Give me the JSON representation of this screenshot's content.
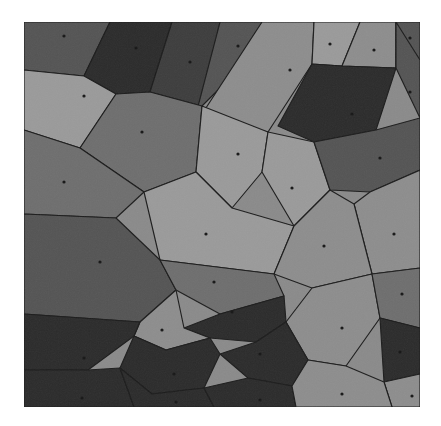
{
  "figure": {
    "kind": "voronoi-tessellation",
    "background_color": "#ffffff",
    "frame": {
      "x": 24,
      "y": 22,
      "width": 396,
      "height": 385
    },
    "boundary_color": "#1c1c1c",
    "boundary_width": 1.15,
    "seed_dot_color": "#161616",
    "seed_dot_radius": 1.6,
    "palette": {
      "very_dark": "#2b2b2b",
      "dark": "#3d3d3d",
      "mid_dark": "#545454",
      "mid": "#6e6e6e",
      "light": "#8d8d8d",
      "lighter": "#9a9a9a"
    }
  },
  "chart_data": {
    "type": "voronoi",
    "title": "",
    "xlabel": "",
    "ylabel": "",
    "xlim": [
      0,
      396
    ],
    "ylim": [
      0,
      385
    ],
    "grid": false,
    "legend": "none",
    "cell_count": 34,
    "cells": [
      {
        "id": 1,
        "fill": "#545454",
        "seed": [
          40,
          14
        ],
        "points": "0,0 86,0 60,54 0,48"
      },
      {
        "id": 2,
        "fill": "#2b2b2b",
        "seed": [
          112,
          26
        ],
        "points": "86,0 148,0 126,70 92,72 60,54"
      },
      {
        "id": 3,
        "fill": "#3d3d3d",
        "seed": [
          166,
          40
        ],
        "points": "148,0 196,0 178,84 126,70"
      },
      {
        "id": 4,
        "fill": "#545454",
        "seed": [
          214,
          24
        ],
        "points": "196,0 238,0 230,32 178,84 172,92"
      },
      {
        "id": 5,
        "fill": "#8d8d8d",
        "seed": [
          266,
          48
        ],
        "points": "238,0 290,0 288,42 244,110 178,92"
      },
      {
        "id": 6,
        "fill": "#9a9a9a",
        "seed": [
          306,
          22
        ],
        "points": "290,0 336,0 318,44 288,42"
      },
      {
        "id": 7,
        "fill": "#8d8d8d",
        "seed": [
          350,
          28
        ],
        "points": "336,0 372,0 372,46 318,44"
      },
      {
        "id": 8,
        "fill": "#545454",
        "seed": [
          386,
          16
        ],
        "points": "372,0 396,0 396,38 372,46"
      },
      {
        "id": 9,
        "fill": "#9a9a9a",
        "seed": [
          60,
          74
        ],
        "points": "0,48 60,54 92,72 56,126 0,108"
      },
      {
        "id": 10,
        "fill": "#6e6e6e",
        "seed": [
          118,
          110
        ],
        "points": "92,72 126,70 178,84 172,150 120,170 56,126"
      },
      {
        "id": 11,
        "fill": "#6e6e6e",
        "seed": [
          40,
          160
        ],
        "points": "0,108 56,126 120,170 92,196 0,192"
      },
      {
        "id": 12,
        "fill": "#9a9a9a",
        "seed": [
          214,
          132
        ],
        "points": "178,84 244,110 238,150 208,186 172,150"
      },
      {
        "id": 13,
        "fill": "#2b2b2b",
        "seed": [
          328,
          92
        ],
        "points": "288,42 318,44 372,46 352,108 290,120 254,104"
      },
      {
        "id": 14,
        "fill": "#545454",
        "seed": [
          386,
          70
        ],
        "points": "372,0 396,38 396,96 372,46"
      },
      {
        "id": 15,
        "fill": "#9a9a9a",
        "seed": [
          268,
          166
        ],
        "points": "244,110 290,120 306,168 270,204 238,150"
      },
      {
        "id": 16,
        "fill": "#545454",
        "seed": [
          356,
          136
        ],
        "points": "352,108 396,96 396,148 346,170 306,168 290,120"
      },
      {
        "id": 17,
        "fill": "#8d8d8d",
        "seed": [
          370,
          212
        ],
        "points": "396,148 396,246 348,252 330,182 346,170"
      },
      {
        "id": 18,
        "fill": "#9a9a9a",
        "seed": [
          182,
          212
        ],
        "points": "172,150 208,186 270,204 250,252 136,238 120,170"
      },
      {
        "id": 19,
        "fill": "#8d8d8d",
        "seed": [
          300,
          224
        ],
        "points": "270,204 306,168 330,182 348,252 288,266 250,252"
      },
      {
        "id": 20,
        "fill": "#545454",
        "seed": [
          76,
          240
        ],
        "points": "0,192 92,196 136,238 152,268 116,300 0,292"
      },
      {
        "id": 21,
        "fill": "#6e6e6e",
        "seed": [
          190,
          260
        ],
        "points": "136,238 250,252 260,274 196,292 152,268"
      },
      {
        "id": 22,
        "fill": "#8d8d8d",
        "seed": [
          318,
          306
        ],
        "points": "288,266 348,252 356,296 322,344 284,338 262,300"
      },
      {
        "id": 23,
        "fill": "#6e6e6e",
        "seed": [
          378,
          272
        ],
        "points": "396,246 396,306 356,296 348,252"
      },
      {
        "id": 24,
        "fill": "#2b2b2b",
        "seed": [
          376,
          330
        ],
        "points": "396,306 396,352 360,360 356,296"
      },
      {
        "id": 25,
        "fill": "#8d8d8d",
        "seed": [
          388,
          374
        ],
        "points": "396,352 396,385 368,385 360,360"
      },
      {
        "id": 26,
        "fill": "#2b2b2b",
        "seed": [
          208,
          290
        ],
        "points": "196,292 260,274 262,300 232,320 186,316 160,306"
      },
      {
        "id": 27,
        "fill": "#2b2b2b",
        "seed": [
          236,
          332
        ],
        "points": "232,320 262,300 284,338 268,364 224,356 196,332"
      },
      {
        "id": 28,
        "fill": "#8d8d8d",
        "seed": [
          138,
          308
        ],
        "points": "116,300 152,268 160,306 186,316 142,328 110,314"
      },
      {
        "id": 29,
        "fill": "#2b2b2b",
        "seed": [
          60,
          336
        ],
        "points": "0,292 116,300 110,314 64,348 0,348"
      },
      {
        "id": 30,
        "fill": "#2b2b2b",
        "seed": [
          150,
          352
        ],
        "points": "110,314 142,328 186,316 196,332 180,366 128,372 96,346"
      },
      {
        "id": 31,
        "fill": "#2b2b2b",
        "seed": [
          58,
          376
        ],
        "points": "0,348 64,348 96,346 110,385 0,385"
      },
      {
        "id": 32,
        "fill": "#2b2b2b",
        "seed": [
          152,
          380
        ],
        "points": "96,346 128,372 180,366 190,385 110,385"
      },
      {
        "id": 33,
        "fill": "#2b2b2b",
        "seed": [
          236,
          378
        ],
        "points": "180,366 224,356 268,364 272,385 190,385"
      },
      {
        "id": 34,
        "fill": "#8d8d8d",
        "seed": [
          318,
          372
        ],
        "points": "268,364 284,338 322,344 360,360 368,385 272,385"
      }
    ],
    "seeds": [
      [
        40,
        14
      ],
      [
        112,
        26
      ],
      [
        166,
        40
      ],
      [
        214,
        24
      ],
      [
        266,
        48
      ],
      [
        306,
        22
      ],
      [
        350,
        28
      ],
      [
        386,
        16
      ],
      [
        60,
        74
      ],
      [
        118,
        110
      ],
      [
        40,
        160
      ],
      [
        214,
        132
      ],
      [
        328,
        92
      ],
      [
        386,
        70
      ],
      [
        268,
        166
      ],
      [
        356,
        136
      ],
      [
        370,
        212
      ],
      [
        182,
        212
      ],
      [
        300,
        224
      ],
      [
        76,
        240
      ],
      [
        190,
        260
      ],
      [
        318,
        306
      ],
      [
        378,
        272
      ],
      [
        376,
        330
      ],
      [
        388,
        374
      ],
      [
        208,
        290
      ],
      [
        236,
        332
      ],
      [
        138,
        308
      ],
      [
        60,
        336
      ],
      [
        150,
        352
      ],
      [
        58,
        376
      ],
      [
        152,
        380
      ],
      [
        236,
        378
      ],
      [
        318,
        372
      ]
    ]
  }
}
